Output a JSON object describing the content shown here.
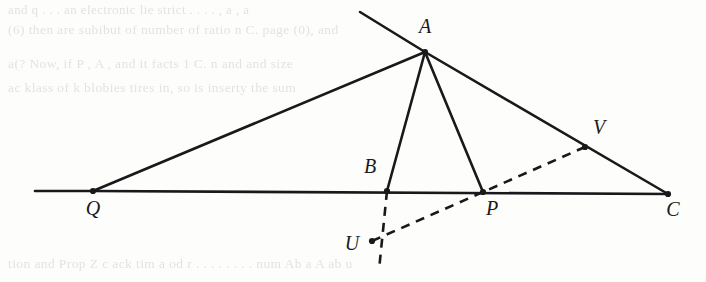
{
  "page": {
    "width": 706,
    "height": 282,
    "background_color": "#fdfdfc",
    "ink_color": "#19191b",
    "bleed_color": "#b9b7b2"
  },
  "figure": {
    "caption": "",
    "points": {
      "A": {
        "label": "A",
        "x": 425,
        "y": 52,
        "label_x": 425,
        "label_y": 33
      },
      "Q": {
        "label": "Q",
        "x": 93,
        "y": 191,
        "label_x": 93,
        "label_y": 215
      },
      "B": {
        "label": "B",
        "x": 387,
        "y": 191,
        "label_x": 370,
        "label_y": 173
      },
      "P": {
        "label": "P",
        "x": 483,
        "y": 192,
        "label_x": 492,
        "label_y": 215
      },
      "C": {
        "label": "C",
        "x": 668,
        "y": 194,
        "label_x": 673,
        "label_y": 216
      },
      "U": {
        "label": "U",
        "x": 372,
        "y": 241,
        "label_x": 352,
        "label_y": 250
      },
      "V": {
        "label": "V",
        "x": 585,
        "y": 147,
        "label_x": 599,
        "label_y": 134
      }
    },
    "solid_segments": [
      {
        "name": "baseline-QC-left-tail",
        "x1": 35,
        "y1": 191,
        "x2": 93,
        "y2": 191
      },
      {
        "name": "baseline-Q-to-C",
        "x1": 93,
        "y1": 191,
        "x2": 668,
        "y2": 194
      },
      {
        "name": "line-through-Q-and-A-upper-extension",
        "x1": 360,
        "y1": 12,
        "x2": 425,
        "y2": 52
      },
      {
        "name": "segment-A-to-Q",
        "x1": 425,
        "y1": 52,
        "x2": 93,
        "y2": 191
      },
      {
        "name": "segment-A-to-B",
        "x1": 425,
        "y1": 52,
        "x2": 387,
        "y2": 191
      },
      {
        "name": "segment-A-to-P",
        "x1": 425,
        "y1": 52,
        "x2": 483,
        "y2": 192
      },
      {
        "name": "segment-A-to-C",
        "x1": 425,
        "y1": 52,
        "x2": 668,
        "y2": 194
      }
    ],
    "dashed_segments": [
      {
        "name": "dashed-B-through-U-extended",
        "x1": 387,
        "y1": 191,
        "x2": 379,
        "y2": 270
      },
      {
        "name": "dashed-U-through-P-to-V",
        "x1": 372,
        "y1": 241,
        "x2": 585,
        "y2": 147
      }
    ],
    "vertex_dots": [
      "A",
      "Q",
      "B",
      "P",
      "C",
      "U",
      "V"
    ],
    "stroke_width_solid": 2.6,
    "stroke_width_dashed": 2.6,
    "dash_pattern": "9 7"
  },
  "bleed_text": {
    "note": "faint show-through text from the reverse side of the scanned page",
    "lines": [
      {
        "id": "t1",
        "text": "and q . . . an electronic lie strict . . . . , a , a",
        "x": 8,
        "y": 2,
        "size": 13
      },
      {
        "id": "t2",
        "text": "(6) then  are subibut of number of ratio n  C. page  (0), and",
        "x": 8,
        "y": 22,
        "size": 13.5
      },
      {
        "id": "t3",
        "text": "a(?  Now, if  P  , A  , and it  facts 1  C. n and and size",
        "x": 8,
        "y": 56,
        "size": 13.5
      },
      {
        "id": "t4",
        "text": "ac   klass  of   k blobies  tires in, so  is  inserty  the  sum",
        "x": 8,
        "y": 80,
        "size": 13.5
      },
      {
        "id": "t5",
        "text": "tion  and  Prop   Z  c ack  tim  a od   r . . . . . . . .  num   Ab  a   A   ab   u",
        "x": 8,
        "y": 256,
        "size": 13.5
      }
    ]
  }
}
